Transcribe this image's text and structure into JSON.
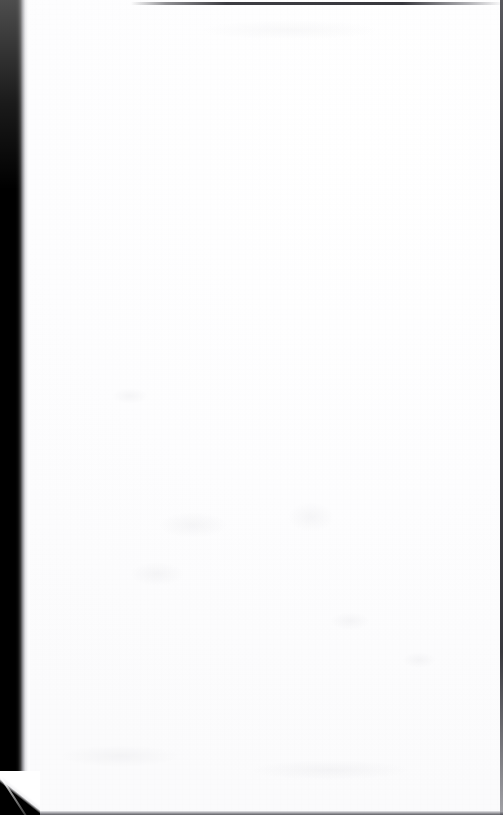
{
  "page": {
    "kind": "scanned-blank-page",
    "width": 503,
    "height": 815,
    "visible_text": "",
    "caption": "",
    "paper_color": "#ffffff",
    "background_color": "#ffffff"
  },
  "artifacts": {
    "gutter_shadow": {
      "name": "left-book-gutter-shadow",
      "color": "#000000",
      "edge_color": "#9a9a9e",
      "width_px": 30,
      "label": ""
    },
    "edge_top": {
      "name": "top-scan-edge-line",
      "color": "#22222a",
      "label": ""
    },
    "edge_right": {
      "name": "right-scan-edge-line",
      "color": "#282830",
      "label": ""
    },
    "edge_bottom": {
      "name": "bottom-scan-edge-line",
      "color": "#3a3a40",
      "label": ""
    },
    "folded_corner": {
      "name": "bottom-left-folded-corner",
      "color": "#000000",
      "crease_color": "#ffffff",
      "label": ""
    },
    "bleed_through": {
      "name": "faint-bleed-through-smudges",
      "color": "#787887",
      "count": 9,
      "label": ""
    }
  }
}
